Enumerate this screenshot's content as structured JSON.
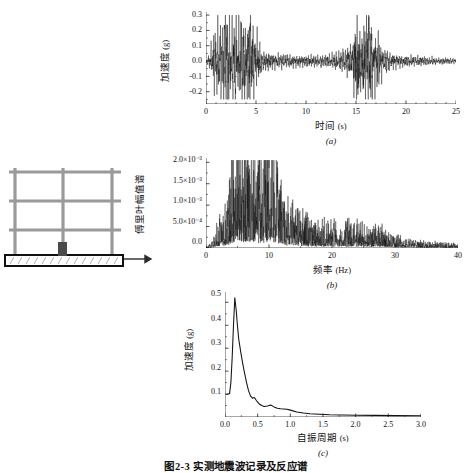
{
  "figure": {
    "caption": "图2-3  实测地震波记录及反应谱"
  },
  "frame_sketch": {
    "name": "三层两跨框架结构示意图",
    "stories": 3,
    "bays": 2,
    "ground_arrow_label": "",
    "base_label": ""
  },
  "chart_data": [
    {
      "id": "a",
      "type": "line",
      "sub_label": "(a)",
      "title": "",
      "xlabel": "时间",
      "xunit": "(s)",
      "ylabel": "加速度",
      "yunit": "(g)",
      "xlim": [
        0,
        25
      ],
      "ylim": [
        -0.28,
        0.32
      ],
      "xticks": [
        0,
        5,
        10,
        15,
        20,
        25
      ],
      "xticklabels": [
        "0",
        "5",
        "10",
        "15",
        "20",
        "25"
      ],
      "yticks": [
        -0.2,
        -0.1,
        0.0,
        0.1,
        0.2,
        0.3
      ],
      "yticklabels": [
        "-0.2",
        "-0.1",
        "0.0",
        "0.1",
        "0.2",
        "0.3"
      ],
      "grid": false,
      "legend": "none",
      "series_name": "地震加速度时程",
      "envelope": [
        {
          "t": 0.0,
          "amp": 0.004
        },
        {
          "t": 0.4,
          "amp": 0.035
        },
        {
          "t": 0.8,
          "amp": 0.115
        },
        {
          "t": 1.2,
          "amp": 0.165
        },
        {
          "t": 1.6,
          "amp": 0.175
        },
        {
          "t": 2.0,
          "amp": 0.235
        },
        {
          "t": 2.4,
          "amp": 0.195
        },
        {
          "t": 2.8,
          "amp": 0.215
        },
        {
          "t": 3.2,
          "amp": 0.175
        },
        {
          "t": 3.6,
          "amp": 0.195
        },
        {
          "t": 4.0,
          "amp": 0.165
        },
        {
          "t": 4.4,
          "amp": 0.225
        },
        {
          "t": 4.8,
          "amp": 0.135
        },
        {
          "t": 5.2,
          "amp": 0.095
        },
        {
          "t": 5.6,
          "amp": 0.042
        },
        {
          "t": 6.5,
          "amp": 0.033
        },
        {
          "t": 7.5,
          "amp": 0.03
        },
        {
          "t": 9.0,
          "amp": 0.026
        },
        {
          "t": 10.5,
          "amp": 0.024
        },
        {
          "t": 12.0,
          "amp": 0.024
        },
        {
          "t": 13.0,
          "amp": 0.032
        },
        {
          "t": 14.0,
          "amp": 0.055
        },
        {
          "t": 14.6,
          "amp": 0.085
        },
        {
          "t": 15.1,
          "amp": 0.255
        },
        {
          "t": 15.5,
          "amp": 0.115
        },
        {
          "t": 16.0,
          "amp": 0.185
        },
        {
          "t": 16.2,
          "amp": 0.265
        },
        {
          "t": 16.6,
          "amp": 0.145
        },
        {
          "t": 17.1,
          "amp": 0.125
        },
        {
          "t": 17.6,
          "amp": 0.07
        },
        {
          "t": 18.2,
          "amp": 0.04
        },
        {
          "t": 19.0,
          "amp": 0.028
        },
        {
          "t": 20.5,
          "amp": 0.022
        },
        {
          "t": 22.0,
          "amp": 0.018
        },
        {
          "t": 23.5,
          "amp": 0.014
        },
        {
          "t": 25.0,
          "amp": 0.01
        }
      ],
      "peak_positive": 0.3,
      "peak_negative": -0.25
    },
    {
      "id": "b",
      "type": "line",
      "sub_label": "(b)",
      "title": "",
      "xlabel": "频率",
      "xunit": "(Hz)",
      "ylabel": "傅里叶幅值谱",
      "yunit": "",
      "xlim": [
        0,
        40
      ],
      "ylim": [
        0,
        0.0021
      ],
      "xticks": [
        0,
        10,
        20,
        30,
        40
      ],
      "xticklabels": [
        "0",
        "10",
        "20",
        "30",
        "40"
      ],
      "yticks": [
        0,
        0.0005,
        0.001,
        0.0015,
        0.002
      ],
      "yticklabels": [
        "0.0",
        "5.0×10⁻⁴",
        "1.0×10⁻³",
        "1.5×10⁻³",
        "2.0×10⁻³"
      ],
      "grid": false,
      "legend": "none",
      "series_name": "傅里叶幅值谱",
      "envelope": [
        {
          "f": 0.0,
          "amp": 2e-05
        },
        {
          "f": 0.8,
          "amp": 8e-05
        },
        {
          "f": 1.5,
          "amp": 0.00028
        },
        {
          "f": 2.2,
          "amp": 0.0004
        },
        {
          "f": 3.0,
          "amp": 0.00062
        },
        {
          "f": 3.6,
          "amp": 0.0009
        },
        {
          "f": 4.2,
          "amp": 0.0015
        },
        {
          "f": 4.8,
          "amp": 0.0012
        },
        {
          "f": 5.4,
          "amp": 0.00135
        },
        {
          "f": 6.0,
          "amp": 0.00125
        },
        {
          "f": 6.6,
          "amp": 0.00148
        },
        {
          "f": 7.2,
          "amp": 0.0013
        },
        {
          "f": 7.8,
          "amp": 0.0016
        },
        {
          "f": 8.4,
          "amp": 0.00135
        },
        {
          "f": 9.0,
          "amp": 0.0012
        },
        {
          "f": 9.6,
          "amp": 0.00155
        },
        {
          "f": 10.2,
          "amp": 0.0019
        },
        {
          "f": 10.8,
          "amp": 0.0015
        },
        {
          "f": 11.4,
          "amp": 0.00125
        },
        {
          "f": 12.0,
          "amp": 0.0009
        },
        {
          "f": 12.8,
          "amp": 0.00065
        },
        {
          "f": 13.6,
          "amp": 0.00072
        },
        {
          "f": 14.5,
          "amp": 0.0006
        },
        {
          "f": 15.5,
          "amp": 0.00048
        },
        {
          "f": 17.0,
          "amp": 0.00042
        },
        {
          "f": 19.0,
          "amp": 0.00036
        },
        {
          "f": 21.0,
          "amp": 0.00034
        },
        {
          "f": 23.0,
          "amp": 0.00038
        },
        {
          "f": 25.0,
          "amp": 0.0003
        },
        {
          "f": 27.0,
          "amp": 0.00032
        },
        {
          "f": 29.0,
          "amp": 0.00024
        },
        {
          "f": 31.0,
          "amp": 0.00014
        },
        {
          "f": 33.0,
          "amp": 0.00011
        },
        {
          "f": 35.0,
          "amp": 9e-05
        },
        {
          "f": 37.0,
          "amp": 8e-05
        },
        {
          "f": 40.0,
          "amp": 6e-05
        }
      ],
      "peak_value": 0.0019,
      "peak_frequency": 10.3
    },
    {
      "id": "c",
      "type": "line",
      "sub_label": "(c)",
      "title": "",
      "xlabel": "自振周期",
      "xunit": "(s)",
      "ylabel": "加速度",
      "yunit": "(g)",
      "xlim": [
        0,
        3.0
      ],
      "ylim": [
        0,
        0.545
      ],
      "xticks": [
        0,
        0.5,
        1.0,
        1.5,
        2.0,
        2.5,
        3.0
      ],
      "xticklabels": [
        "0.0",
        "0.5",
        "1.0",
        "1.5",
        "2.0",
        "2.5",
        "3.0"
      ],
      "yticks": [
        0.1,
        0.2,
        0.3,
        0.4,
        0.5
      ],
      "yticklabels": [
        "0.1",
        "0.2",
        "0.3",
        "0.4",
        "0.5"
      ],
      "grid": false,
      "legend": "none",
      "series_name": "加速度反应谱",
      "points": [
        {
          "T": 0.02,
          "Sa": 0.098
        },
        {
          "T": 0.05,
          "Sa": 0.1
        },
        {
          "T": 0.07,
          "Sa": 0.102
        },
        {
          "T": 0.09,
          "Sa": 0.15
        },
        {
          "T": 0.11,
          "Sa": 0.26
        },
        {
          "T": 0.13,
          "Sa": 0.4
        },
        {
          "T": 0.15,
          "Sa": 0.52
        },
        {
          "T": 0.17,
          "Sa": 0.47
        },
        {
          "T": 0.19,
          "Sa": 0.4
        },
        {
          "T": 0.21,
          "Sa": 0.34
        },
        {
          "T": 0.24,
          "Sa": 0.285
        },
        {
          "T": 0.27,
          "Sa": 0.235
        },
        {
          "T": 0.3,
          "Sa": 0.19
        },
        {
          "T": 0.33,
          "Sa": 0.15
        },
        {
          "T": 0.36,
          "Sa": 0.115
        },
        {
          "T": 0.39,
          "Sa": 0.092
        },
        {
          "T": 0.42,
          "Sa": 0.082
        },
        {
          "T": 0.45,
          "Sa": 0.085
        },
        {
          "T": 0.48,
          "Sa": 0.072
        },
        {
          "T": 0.52,
          "Sa": 0.058
        },
        {
          "T": 0.56,
          "Sa": 0.05
        },
        {
          "T": 0.6,
          "Sa": 0.046
        },
        {
          "T": 0.65,
          "Sa": 0.048
        },
        {
          "T": 0.7,
          "Sa": 0.052
        },
        {
          "T": 0.75,
          "Sa": 0.044
        },
        {
          "T": 0.8,
          "Sa": 0.038
        },
        {
          "T": 0.85,
          "Sa": 0.036
        },
        {
          "T": 0.9,
          "Sa": 0.035
        },
        {
          "T": 0.95,
          "Sa": 0.034
        },
        {
          "T": 1.0,
          "Sa": 0.03
        },
        {
          "T": 1.1,
          "Sa": 0.022
        },
        {
          "T": 1.2,
          "Sa": 0.017
        },
        {
          "T": 1.3,
          "Sa": 0.014
        },
        {
          "T": 1.45,
          "Sa": 0.012
        },
        {
          "T": 1.6,
          "Sa": 0.01
        },
        {
          "T": 1.8,
          "Sa": 0.009
        },
        {
          "T": 2.0,
          "Sa": 0.008
        },
        {
          "T": 2.3,
          "Sa": 0.007
        },
        {
          "T": 2.6,
          "Sa": 0.006
        },
        {
          "T": 3.0,
          "Sa": 0.005
        }
      ],
      "peak_value": 0.52,
      "peak_period": 0.15
    }
  ],
  "colors": {
    "line": "#111111",
    "axis": "#222222",
    "frame": "#8a8a8a",
    "frame_dark": "#3a3a3a",
    "background": "#ffffff"
  }
}
